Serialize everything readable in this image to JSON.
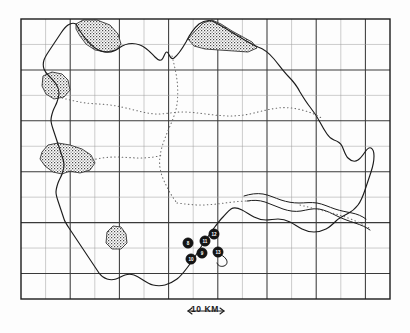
{
  "figure": {
    "type": "map",
    "caption_text": "",
    "background_color": "#fdfdfd",
    "ink_color": "#1c1c1c"
  },
  "frame": {
    "x": 21,
    "y": 19,
    "width": 369,
    "height": 280,
    "border_color": "#1c1c1c",
    "border_width": 1.4
  },
  "grid": {
    "major_color": "#3a3a3a",
    "minor_color": "#9a9a9a",
    "major_width": 1.1,
    "minor_width": 0.5,
    "columns": 15,
    "rows": 11,
    "cell_width": 24.6,
    "cell_height": 25.45,
    "major_every": 2
  },
  "scalebar": {
    "label": "10 KM",
    "length_px": 36,
    "arrow": "double-headed",
    "color": "#1c1c1c"
  },
  "boundaries": {
    "coastline_color": "#1c1c1c",
    "coastline_width": 1.1,
    "dotted_color": "#6a6a6a",
    "dotted_label": "internal-boundary"
  },
  "stipple_regions": [
    {
      "name": "stipple-region-north-west",
      "fill": "pattern-stipple"
    },
    {
      "name": "stipple-region-north-east",
      "fill": "pattern-stipple"
    },
    {
      "name": "stipple-region-west-upper",
      "fill": "pattern-stipple"
    },
    {
      "name": "stipple-region-west-lower",
      "fill": "pattern-stipple"
    },
    {
      "name": "stipple-region-south-central",
      "fill": "pattern-stipple"
    }
  ],
  "markers": {
    "style": "filled-circle-numbered",
    "fill": "#141414",
    "text_color": "#ffffff",
    "radius": 5.2,
    "points": [
      {
        "id": "marker-1",
        "label": "8",
        "x": 188,
        "y": 243
      },
      {
        "id": "marker-2",
        "label": "11",
        "x": 205,
        "y": 241
      },
      {
        "id": "marker-3",
        "label": "12",
        "x": 214,
        "y": 234
      },
      {
        "id": "marker-4",
        "label": "9",
        "x": 202,
        "y": 253
      },
      {
        "id": "marker-5",
        "label": "13",
        "x": 218,
        "y": 252
      },
      {
        "id": "marker-6",
        "label": "10",
        "x": 191,
        "y": 259
      }
    ]
  }
}
